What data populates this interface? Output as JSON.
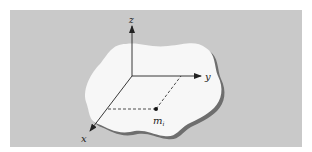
{
  "figure": {
    "background_color": "#c9c9c9",
    "blob_color": "#f7f7f7",
    "shadow_color": "#6e6e6e",
    "axes": {
      "z_label": "z",
      "y_label": "y",
      "x_label": "x"
    },
    "point": {
      "label": "m",
      "subscript": "i"
    }
  }
}
